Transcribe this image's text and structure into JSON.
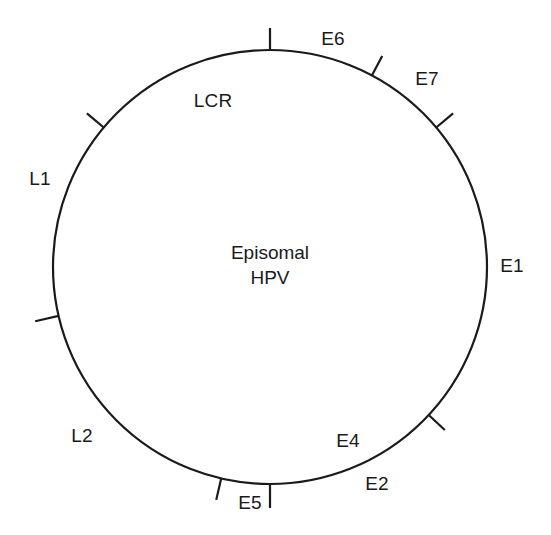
{
  "figure": {
    "kind": "circular-genome-map",
    "center_text": {
      "line1": "Episomal",
      "line2": "HPV"
    },
    "circle": {
      "cx": 270,
      "cy": 267,
      "r": 217,
      "stroke_color": "#1a1a1a",
      "stroke_width": 2.2,
      "fill": "none"
    },
    "background_color": "#ffffff",
    "text_color": "#1a1a1a"
  },
  "labels": [
    {
      "id": "e6",
      "text": "E6",
      "x": 333,
      "y": 39
    },
    {
      "id": "e7",
      "text": "E7",
      "x": 427,
      "y": 79
    },
    {
      "id": "e1",
      "text": "E1",
      "x": 512,
      "y": 266
    },
    {
      "id": "e2",
      "text": "E2",
      "x": 377,
      "y": 484
    },
    {
      "id": "e4",
      "text": "E4",
      "x": 348,
      "y": 441
    },
    {
      "id": "e5",
      "text": "E5",
      "x": 250,
      "y": 503
    },
    {
      "id": "l2",
      "text": "L2",
      "x": 82,
      "y": 436
    },
    {
      "id": "l1",
      "text": "L1",
      "x": 40,
      "y": 179
    },
    {
      "id": "lcr",
      "text": "LCR",
      "x": 213,
      "y": 101
    }
  ],
  "ticks": [
    {
      "id": "tick-top",
      "angle_deg": -90,
      "inner": 0,
      "outer": 22
    },
    {
      "id": "tick-upper-left",
      "angle_deg": -140,
      "inner": 0,
      "outer": 22
    },
    {
      "id": "tick-upper-right",
      "angle_deg": -62,
      "inner": 0,
      "outer": 22
    },
    {
      "id": "tick-right-upper",
      "angle_deg": -40,
      "inner": 0,
      "outer": 22
    },
    {
      "id": "tick-lower-right",
      "angle_deg": 43,
      "inner": 0,
      "outer": 22
    },
    {
      "id": "tick-bottom",
      "angle_deg": 90,
      "inner": 0,
      "outer": 24
    },
    {
      "id": "tick-bottom-left",
      "angle_deg": 103,
      "inner": 0,
      "outer": 22
    },
    {
      "id": "tick-left",
      "angle_deg": 167,
      "inner": 0,
      "outer": 24
    }
  ]
}
